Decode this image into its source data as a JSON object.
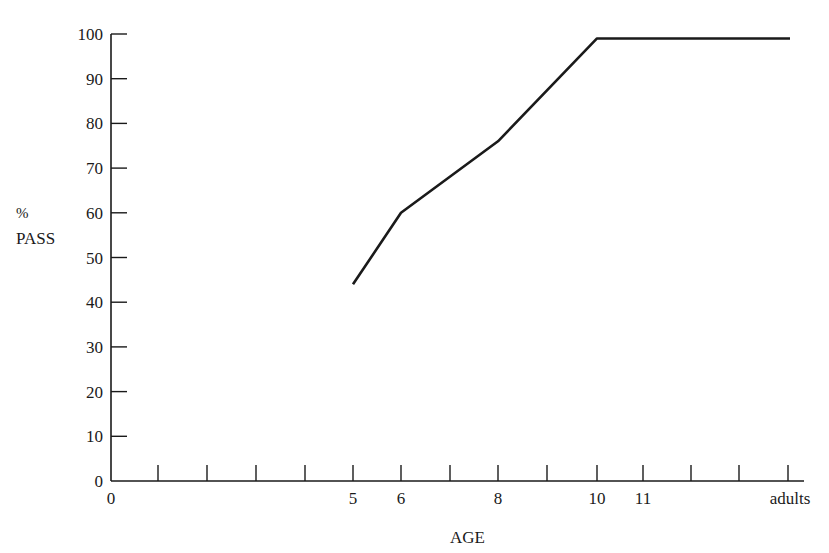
{
  "chart_data": {
    "type": "line",
    "title": "",
    "xlabel": "AGE",
    "ylabel_line1": "%",
    "ylabel_line2": "PASS",
    "ylim": [
      0,
      100
    ],
    "grid": false,
    "legend": null,
    "y_ticks": [
      "0",
      "10",
      "20",
      "30",
      "40",
      "50",
      "60",
      "70",
      "80",
      "90",
      "100"
    ],
    "x_ticks": [
      {
        "pos": 0,
        "label": "0"
      },
      {
        "pos": 1,
        "label": ""
      },
      {
        "pos": 2,
        "label": ""
      },
      {
        "pos": 3,
        "label": ""
      },
      {
        "pos": 4,
        "label": ""
      },
      {
        "pos": 5,
        "label": "5"
      },
      {
        "pos": 6,
        "label": "6"
      },
      {
        "pos": 7,
        "label": ""
      },
      {
        "pos": 8,
        "label": "8"
      },
      {
        "pos": 9,
        "label": ""
      },
      {
        "pos": 10,
        "label": "10"
      },
      {
        "pos": 11,
        "label": "11"
      },
      {
        "pos": 12,
        "label": ""
      },
      {
        "pos": 13,
        "label": ""
      },
      {
        "pos": 14,
        "label": "adults"
      }
    ],
    "series": [
      {
        "name": "% pass",
        "x": [
          "5",
          "6",
          "8",
          "10",
          "adults"
        ],
        "x_pos": [
          5,
          6,
          8,
          10,
          14
        ],
        "values": [
          44,
          60,
          76,
          99,
          99
        ]
      }
    ],
    "color": "#1a1a1a"
  }
}
